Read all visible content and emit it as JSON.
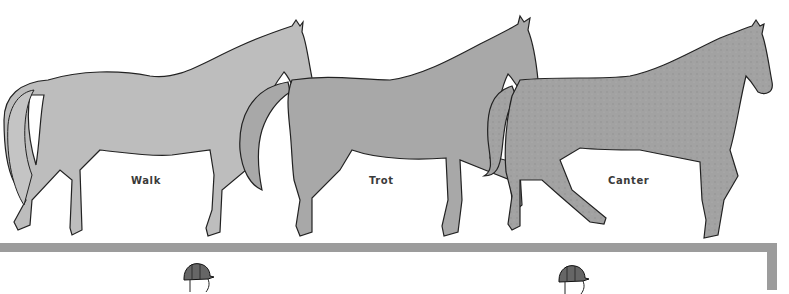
{
  "figure": {
    "gaits": [
      {
        "label": "Walk",
        "fill": "#bdbdbd"
      },
      {
        "label": "Trot",
        "fill": "#a8a8a8"
      },
      {
        "label": "Canter",
        "fill": "#a2a2a2"
      }
    ],
    "divider_color": "#9c9c9c",
    "riders": [
      {
        "icon": "rider-helmet-icon"
      },
      {
        "icon": "rider-helmet-icon"
      }
    ]
  }
}
